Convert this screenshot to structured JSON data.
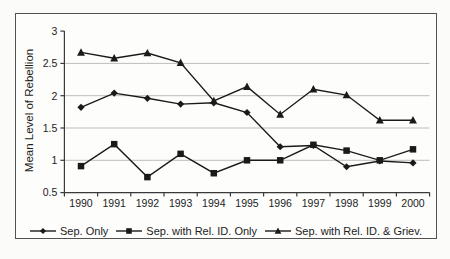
{
  "figure": {
    "background": "#fdfdfb",
    "border_color": "#525252",
    "text_color": "#1c1c1c",
    "gridline_color": "#bdbdbd",
    "axis_color": "#3a3a3a",
    "series_color": "#1a1a1a"
  },
  "chart_data": {
    "type": "line",
    "title": "",
    "xlabel": "",
    "ylabel": "Mean Level of Rebellion",
    "ylim": [
      0.5,
      3
    ],
    "ytick_step": 0.5,
    "ytick_labels": [
      "3",
      "2.5",
      "2",
      "1.5",
      "1",
      "0.5"
    ],
    "grid": "horizontal, light gray, at 1 / 1.5 / 2 / 2.5",
    "legend_position": "bottom",
    "categories": [
      "1990",
      "1991",
      "1992",
      "1993",
      "1994",
      "1995",
      "1996",
      "1997",
      "1998",
      "1999",
      "2000"
    ],
    "series": [
      {
        "name": "Sep. Only",
        "marker": "diamond",
        "color": "#1a1a1a",
        "values": [
          1.82,
          2.04,
          1.96,
          1.87,
          1.89,
          1.74,
          1.21,
          1.23,
          0.9,
          0.99,
          0.96
        ]
      },
      {
        "name": "Sep. with Rel. ID. Only",
        "marker": "square",
        "color": "#1a1a1a",
        "values": [
          0.91,
          1.25,
          0.74,
          1.1,
          0.8,
          1.0,
          1.0,
          1.24,
          1.15,
          1.0,
          1.17
        ]
      },
      {
        "name": "Sep. with Rel. ID. & Griev.",
        "marker": "triangle",
        "color": "#1a1a1a",
        "values": [
          2.67,
          2.58,
          2.66,
          2.51,
          1.92,
          2.14,
          1.71,
          2.1,
          2.01,
          1.62,
          1.62
        ]
      }
    ]
  }
}
